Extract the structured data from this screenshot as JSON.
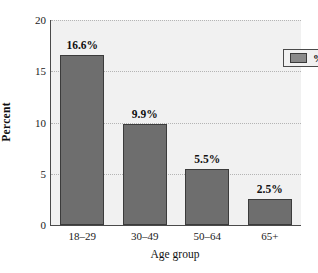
{
  "chart_data": {
    "type": "bar",
    "title": "",
    "subtitle": "",
    "xlabel": "Age group",
    "ylabel": "Percent",
    "categories": [
      "18–29",
      "30–49",
      "50–64",
      "65+"
    ],
    "values": [
      16.6,
      9.9,
      5.5,
      2.5
    ],
    "data_labels": [
      "16.6%",
      "9.9%",
      "5.5%",
      "2.5%"
    ],
    "series": [
      {
        "name": "% Yes",
        "values": [
          16.6,
          9.9,
          5.5,
          2.5
        ]
      }
    ],
    "ylim": [
      0,
      20
    ],
    "yticks": [
      0,
      5,
      10,
      15,
      20
    ],
    "ytick_labels": [
      "0",
      "5",
      "10",
      "15",
      "20"
    ],
    "grid": true,
    "grid_axis": "y",
    "legend": {
      "position": "top-right",
      "entries": [
        {
          "label": "% Yes",
          "color": "#8a8a8a"
        }
      ]
    },
    "colors": {
      "bar_fill": "#6e6e6e",
      "bar_edge": "#3b3b3b",
      "plot_background": "#f1f1f1",
      "figure_background": "#ffffff",
      "gridline": "#b4b4b4",
      "axis": "#4a4a4a",
      "text": "#111111"
    }
  }
}
